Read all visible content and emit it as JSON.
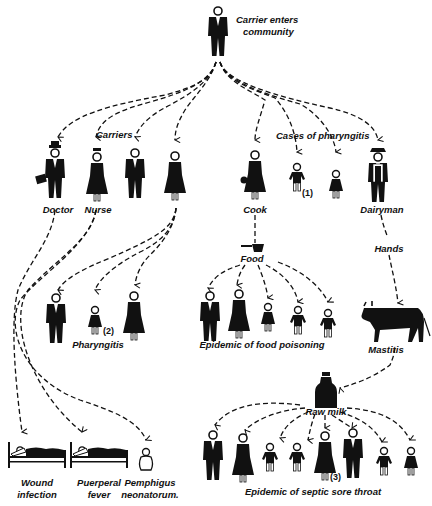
{
  "root": {
    "label_line1": "Carrier enters",
    "label_line2": "community"
  },
  "carriers": {
    "group_label": "Carriers",
    "doctor": "Doctor",
    "nurse": "Nurse"
  },
  "pharyngitis_cases": {
    "group_label": "Cases of pharyngitis",
    "count_label": "(1)"
  },
  "cook": "Cook",
  "dairyman": "Dairyman",
  "food": "Food",
  "hands": "Hands",
  "mastitis": "Mastitis",
  "raw_milk": "Raw milk",
  "pharyngitis_group": {
    "label": "Pharyngitis",
    "count_label": "(2)"
  },
  "food_poisoning": {
    "label": "Epidemic of food poisoning"
  },
  "septic_sore_throat": {
    "label": "Epidemic of septic sore throat",
    "count_label": "(3)"
  },
  "hospital_outcomes": {
    "wound": {
      "line1": "Wound",
      "line2": "infection"
    },
    "puerperal": {
      "line1": "Puerperal",
      "line2": "fever"
    },
    "pemphigus": {
      "line1": "Pemphigus",
      "line2": "neonatorum."
    }
  },
  "colors": {
    "ink": "#111111",
    "background": "#ffffff"
  }
}
